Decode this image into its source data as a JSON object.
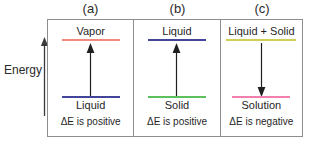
{
  "figure": {
    "energy_axis": {
      "label": "Energy",
      "direction": "up",
      "arrow_icon": "up-arrow-icon"
    },
    "panels": [
      {
        "caption": "(a)",
        "upper_level": {
          "label": "Vapor",
          "color": "#f08a7e"
        },
        "lower_level": {
          "label": "Liquid",
          "color": "#43459a"
        },
        "arrow": {
          "direction": "up",
          "icon": "up-arrow-icon",
          "color": "#1f1f1f"
        },
        "delta_caption": "ΔE is positive"
      },
      {
        "caption": "(b)",
        "upper_level": {
          "label": "Liquid",
          "color": "#43459a"
        },
        "lower_level": {
          "label": "Solid",
          "color": "#5cc05c"
        },
        "arrow": {
          "direction": "up",
          "icon": "up-arrow-icon",
          "color": "#1f1f1f"
        },
        "delta_caption": "ΔE is positive"
      },
      {
        "caption": "(c)",
        "upper_level": {
          "label": "Liquid + Solid",
          "color": "#cfcf54"
        },
        "lower_level": {
          "label": "Solution",
          "color": "#f37fae"
        },
        "arrow": {
          "direction": "down",
          "icon": "down-arrow-icon",
          "color": "#1f1f1f"
        },
        "delta_caption": "ΔE is negative"
      }
    ],
    "colors": {
      "background": "#ffffff",
      "border": "#8d8d8d",
      "text": "#1f1f1f",
      "axis": "#3a3a3a"
    }
  }
}
